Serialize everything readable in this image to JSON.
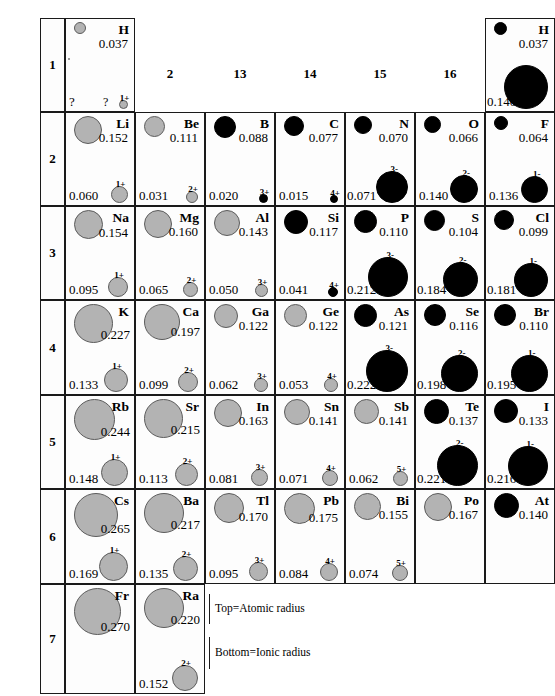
{
  "figure": {
    "kind": "periodic-table-radii-chart",
    "legend": {
      "top_label": "Top=Atomic radius",
      "bottom_label": "Bottom=Ionic radius"
    },
    "group_headers": [
      "2",
      "13",
      "14",
      "15",
      "16"
    ],
    "period_labels": [
      "1",
      "2",
      "3",
      "4",
      "5",
      "6",
      "7"
    ]
  },
  "chart_data": {
    "type": "table",
    "units": "nm",
    "columns": [
      "1",
      "2",
      "13",
      "14",
      "15",
      "16",
      "17"
    ],
    "rows": [
      {
        "period": "1",
        "cells": [
          {
            "symbol": "H",
            "atomic_radius": "0.037",
            "atom_fill": "grey",
            "atom_px": 10,
            "ion_charge": "1+",
            "ionic_radius": "?",
            "ion_fill": "grey",
            "ion_px": 7,
            "group": "1"
          },
          {
            "symbol": "H",
            "atomic_radius": "0.037",
            "atom_fill": "black",
            "atom_px": 11,
            "ion_charge": "",
            "ionic_radius": "0.140",
            "ion_fill": "black",
            "ion_px": 42,
            "group": "17"
          }
        ]
      },
      {
        "period": "2",
        "cells": [
          {
            "symbol": "Li",
            "atomic_radius": "0.152",
            "atom_fill": "grey",
            "atom_px": 26,
            "ion_charge": "1+",
            "ionic_radius": "0.060",
            "ion_fill": "grey",
            "ion_px": 15
          },
          {
            "symbol": "Be",
            "atomic_radius": "0.111",
            "atom_fill": "grey",
            "atom_px": 19,
            "ion_charge": "2+",
            "ionic_radius": "0.031",
            "ion_fill": "grey",
            "ion_px": 10
          },
          {
            "symbol": "B",
            "atomic_radius": "0.088",
            "atom_fill": "black",
            "atom_px": 20,
            "ion_charge": "3+",
            "ionic_radius": "0.020",
            "ion_fill": "black",
            "ion_px": 7
          },
          {
            "symbol": "C",
            "atomic_radius": "0.077",
            "atom_fill": "black",
            "atom_px": 18,
            "ion_charge": "4+",
            "ionic_radius": "0.015",
            "ion_fill": "black",
            "ion_px": 6
          },
          {
            "symbol": "N",
            "atomic_radius": "0.070",
            "atom_fill": "black",
            "atom_px": 16,
            "ion_charge": "3-",
            "ionic_radius": "0.071",
            "ion_fill": "black",
            "ion_px": 30
          },
          {
            "symbol": "O",
            "atomic_radius": "0.066",
            "atom_fill": "black",
            "atom_px": 15,
            "ion_charge": "2-",
            "ionic_radius": "0.140",
            "ion_fill": "black",
            "ion_px": 26
          },
          {
            "symbol": "F",
            "atomic_radius": "0.064",
            "atom_fill": "black",
            "atom_px": 12,
            "ion_charge": "1-",
            "ionic_radius": "0.136",
            "ion_fill": "black",
            "ion_px": 25
          }
        ]
      },
      {
        "period": "3",
        "cells": [
          {
            "symbol": "Na",
            "atomic_radius": "0.154",
            "atom_fill": "grey",
            "atom_px": 27,
            "ion_charge": "1+",
            "ionic_radius": "0.095",
            "ion_fill": "grey",
            "ion_px": 18
          },
          {
            "symbol": "Mg",
            "atomic_radius": "0.160",
            "atom_fill": "grey",
            "atom_px": 26,
            "ion_charge": "2+",
            "ionic_radius": "0.065",
            "ion_fill": "grey",
            "ion_px": 13
          },
          {
            "symbol": "Al",
            "atomic_radius": "0.143",
            "atom_fill": "grey",
            "atom_px": 24,
            "ion_charge": "3+",
            "ionic_radius": "0.050",
            "ion_fill": "grey",
            "ion_px": 11
          },
          {
            "symbol": "Si",
            "atomic_radius": "0.117",
            "atom_fill": "black",
            "atom_px": 22,
            "ion_charge": "4+",
            "ionic_radius": "0.041",
            "ion_fill": "black",
            "ion_px": 8
          },
          {
            "symbol": "P",
            "atomic_radius": "0.110",
            "atom_fill": "black",
            "atom_px": 21,
            "ion_charge": "3-",
            "ionic_radius": "0.212",
            "ion_fill": "black",
            "ion_px": 38
          },
          {
            "symbol": "S",
            "atomic_radius": "0.104",
            "atom_fill": "black",
            "atom_px": 19,
            "ion_charge": "2-",
            "ionic_radius": "0.184",
            "ion_fill": "black",
            "ion_px": 33
          },
          {
            "symbol": "Cl",
            "atomic_radius": "0.099",
            "atom_fill": "black",
            "atom_px": 18,
            "ion_charge": "1-",
            "ionic_radius": "0.181",
            "ion_fill": "black",
            "ion_px": 32
          }
        ]
      },
      {
        "period": "4",
        "cells": [
          {
            "symbol": "K",
            "atomic_radius": "0.227",
            "atom_fill": "grey",
            "atom_px": 37,
            "ion_charge": "1+",
            "ionic_radius": "0.133",
            "ion_fill": "grey",
            "ion_px": 22
          },
          {
            "symbol": "Ca",
            "atomic_radius": "0.197",
            "atom_fill": "grey",
            "atom_px": 34,
            "ion_charge": "2+",
            "ionic_radius": "0.099",
            "ion_fill": "grey",
            "ion_px": 18
          },
          {
            "symbol": "Ga",
            "atomic_radius": "0.122",
            "atom_fill": "grey",
            "atom_px": 22,
            "ion_charge": "3+",
            "ionic_radius": "0.062",
            "ion_fill": "grey",
            "ion_px": 12
          },
          {
            "symbol": "Ge",
            "atomic_radius": "0.122",
            "atom_fill": "grey",
            "atom_px": 21,
            "ion_charge": "4+",
            "ionic_radius": "0.053",
            "ion_fill": "grey",
            "ion_px": 12
          },
          {
            "symbol": "As",
            "atomic_radius": "0.121",
            "atom_fill": "black",
            "atom_px": 21,
            "ion_charge": "3-",
            "ionic_radius": "0.222",
            "ion_fill": "black",
            "ion_px": 40
          },
          {
            "symbol": "Se",
            "atomic_radius": "0.116",
            "atom_fill": "black",
            "atom_px": 20,
            "ion_charge": "2-",
            "ionic_radius": "0.198",
            "ion_fill": "black",
            "ion_px": 35
          },
          {
            "symbol": "Br",
            "atomic_radius": "0.110",
            "atom_fill": "black",
            "atom_px": 20,
            "ion_charge": "1-",
            "ionic_radius": "0.195",
            "ion_fill": "black",
            "ion_px": 35
          }
        ]
      },
      {
        "period": "5",
        "cells": [
          {
            "symbol": "Rb",
            "atomic_radius": "0.244",
            "atom_fill": "grey",
            "atom_px": 39,
            "ion_charge": "1+",
            "ionic_radius": "0.148",
            "ion_fill": "grey",
            "ion_px": 25
          },
          {
            "symbol": "Sr",
            "atomic_radius": "0.215",
            "atom_fill": "grey",
            "atom_px": 37,
            "ion_charge": "2+",
            "ionic_radius": "0.113",
            "ion_fill": "grey",
            "ion_px": 21
          },
          {
            "symbol": "In",
            "atomic_radius": "0.163",
            "atom_fill": "grey",
            "atom_px": 26,
            "ion_charge": "3+",
            "ionic_radius": "0.081",
            "ion_fill": "grey",
            "ion_px": 15
          },
          {
            "symbol": "Sn",
            "atomic_radius": "0.141",
            "atom_fill": "grey",
            "atom_px": 24,
            "ion_charge": "4+",
            "ionic_radius": "0.071",
            "ion_fill": "grey",
            "ion_px": 14
          },
          {
            "symbol": "Sb",
            "atomic_radius": "0.141",
            "atom_fill": "grey",
            "atom_px": 23,
            "ion_charge": "5+",
            "ionic_radius": "0.062",
            "ion_fill": "grey",
            "ion_px": 13
          },
          {
            "symbol": "Te",
            "atomic_radius": "0.137",
            "atom_fill": "black",
            "atom_px": 23,
            "ion_charge": "2-",
            "ionic_radius": "0.221",
            "ion_fill": "black",
            "ion_px": 39
          },
          {
            "symbol": "I",
            "atomic_radius": "0.133",
            "atom_fill": "black",
            "atom_px": 22,
            "ion_charge": "1-",
            "ionic_radius": "0.216",
            "ion_fill": "black",
            "ion_px": 38
          }
        ]
      },
      {
        "period": "6",
        "cells": [
          {
            "symbol": "Cs",
            "atomic_radius": "0.265",
            "atom_fill": "grey",
            "atom_px": 42,
            "ion_charge": "1+",
            "ionic_radius": "0.169",
            "ion_fill": "grey",
            "ion_px": 27
          },
          {
            "symbol": "Ba",
            "atomic_radius": "0.217",
            "atom_fill": "grey",
            "atom_px": 38,
            "ion_charge": "2+",
            "ionic_radius": "0.135",
            "ion_fill": "grey",
            "ion_px": 23
          },
          {
            "symbol": "Tl",
            "atomic_radius": "0.170",
            "atom_fill": "grey",
            "atom_px": 28,
            "ion_charge": "3+",
            "ionic_radius": "0.095",
            "ion_fill": "grey",
            "ion_px": 17
          },
          {
            "symbol": "Pb",
            "atomic_radius": "0.175",
            "atom_fill": "grey",
            "atom_px": 29,
            "ion_charge": "4+",
            "ionic_radius": "0.084",
            "ion_fill": "grey",
            "ion_px": 16
          },
          {
            "symbol": "Bi",
            "atomic_radius": "0.155",
            "atom_fill": "grey",
            "atom_px": 25,
            "ion_charge": "5+",
            "ionic_radius": "0.074",
            "ion_fill": "grey",
            "ion_px": 14
          },
          {
            "symbol": "Po",
            "atomic_radius": "0.167",
            "atom_fill": "grey",
            "atom_px": 26,
            "ion_charge": "",
            "ionic_radius": "",
            "ion_fill": "none",
            "ion_px": 0
          },
          {
            "symbol": "At",
            "atomic_radius": "0.140",
            "atom_fill": "black",
            "atom_px": 23,
            "ion_charge": "",
            "ionic_radius": "",
            "ion_fill": "none",
            "ion_px": 0
          }
        ]
      },
      {
        "period": "7",
        "cells": [
          {
            "symbol": "Fr",
            "atomic_radius": "0.270",
            "atom_fill": "grey",
            "atom_px": 45,
            "ion_charge": "",
            "ionic_radius": "",
            "ion_fill": "none",
            "ion_px": 0
          },
          {
            "symbol": "Ra",
            "atomic_radius": "0.220",
            "atom_fill": "grey",
            "atom_px": 38,
            "ion_charge": "2+",
            "ionic_radius": "0.152",
            "ion_fill": "grey",
            "ion_px": 24
          }
        ]
      }
    ]
  }
}
